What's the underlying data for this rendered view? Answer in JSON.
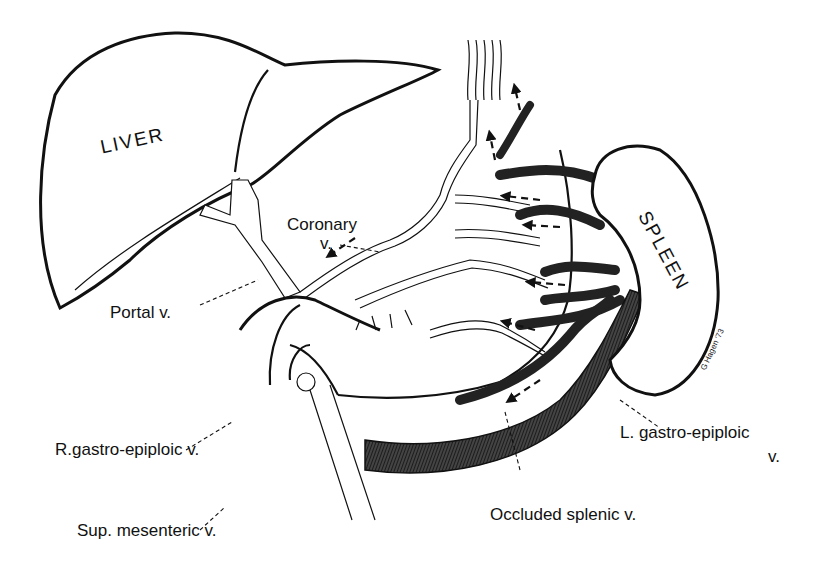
{
  "organs": {
    "liver": "LIVER",
    "spleen": "SPLEEN"
  },
  "labels": {
    "coronary_line1": "Coronary",
    "coronary_line2": "v.",
    "portal": "Portal v.",
    "r_gastro_epiploic": "R.gastro-epiploic v.",
    "l_gastro_epiploic_line1": "L. gastro-epiploic",
    "l_gastro_epiploic_line2": "v.",
    "sup_mesenteric": "Sup. mesenteric v.",
    "occluded_splenic": "Occluded splenic v."
  },
  "signature": "G Hagen '73"
}
